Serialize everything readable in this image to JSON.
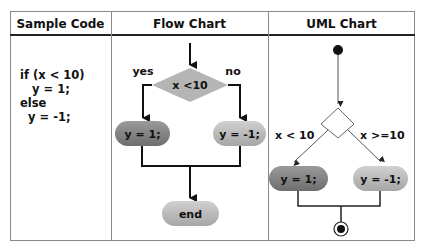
{
  "table": {
    "headers": [
      "Sample Code",
      "Flow Chart",
      "UML Chart"
    ]
  },
  "sample_code": {
    "lines": [
      "if (x < 10)",
      "   y = 1;",
      "else",
      "  y = -1;"
    ]
  },
  "flow_chart": {
    "condition": "x <10",
    "yes_label": "yes",
    "no_label": "no",
    "true_action": "y = 1;",
    "false_action": "y = -1;",
    "end_label": "end"
  },
  "uml_chart": {
    "guard_true": "x < 10",
    "guard_false": "x >=10",
    "true_action": "y = 1;",
    "false_action": "y = -1;"
  },
  "colors": {
    "diamond_fill": "#b5b5b5",
    "dark_node": "#7f7f7f",
    "light_node": "#b8b8b8",
    "line": "#111111"
  }
}
